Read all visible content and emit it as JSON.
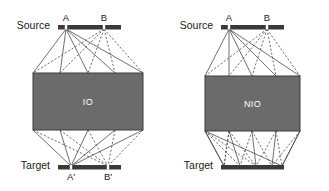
{
  "figure": {
    "background_color": "#ffffff",
    "line_color": "#4a4a4a",
    "box_fill": "#6b6b6b",
    "box_stroke": "#3c3c3c",
    "bar_color": "#3a3a3a",
    "label_color": "#1a1a1a",
    "box_label_color": "#ffffff"
  },
  "panels": [
    {
      "id": "left-panel",
      "box_label": "IO",
      "source_label": "Source",
      "target_label": "Target",
      "source_nodes": [
        {
          "label": "A",
          "x": 66
        },
        {
          "label": "B",
          "x": 104
        }
      ],
      "target_nodes": [
        {
          "label": "A'",
          "x": 71
        },
        {
          "label": "B'",
          "x": 108
        }
      ],
      "bars": {
        "source": {
          "x1": 58,
          "x2": 121,
          "y": 27
        },
        "target": {
          "x1": 58,
          "x2": 121,
          "y": 167
        }
      },
      "box": {
        "x": 33,
        "y": 73,
        "width": 110,
        "height": 57
      },
      "converging_target": true
    },
    {
      "id": "right-panel",
      "box_label": "NIO",
      "source_label": "Source",
      "target_label": "Target",
      "source_nodes": [
        {
          "label": "A",
          "x": 229
        },
        {
          "label": "B",
          "x": 267
        }
      ],
      "target_nodes": [],
      "bars": {
        "source": {
          "x1": 221,
          "x2": 284,
          "y": 27
        },
        "target": {
          "x1": 221,
          "x2": 284,
          "y": 167
        }
      },
      "box": {
        "x": 205,
        "y": 76,
        "width": 95,
        "height": 55
      },
      "converging_target": false
    }
  ],
  "geometry": {
    "top_fan_targets_left": [
      33,
      60,
      88,
      115,
      143
    ],
    "bottom_fan_sources_left": [
      33,
      60,
      88,
      115,
      143
    ],
    "top_fan_targets_right": [
      205,
      229,
      252,
      276,
      300
    ],
    "bottom_fan_sources_right": [
      205,
      229,
      252,
      276,
      300
    ],
    "right_bottom_endpoints": [
      224,
      240,
      256,
      272,
      282
    ]
  }
}
